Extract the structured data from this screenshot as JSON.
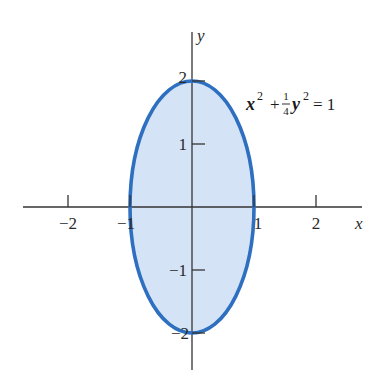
{
  "diagram": {
    "type": "ellipse-region",
    "equation": {
      "display": "x² + ¼y² = 1",
      "x_var": "x",
      "y_var": "y",
      "exp": "2",
      "plus": "+",
      "frac_num": "1",
      "frac_den": "4",
      "equals": "= 1"
    },
    "axes": {
      "x_label": "x",
      "y_label": "y",
      "x_ticks": [
        {
          "value": -2,
          "label": "−2"
        },
        {
          "value": -1,
          "label": "−1"
        },
        {
          "value": 1,
          "label": "1"
        },
        {
          "value": 2,
          "label": "2"
        }
      ],
      "y_ticks": [
        {
          "value": 2,
          "label": "2"
        },
        {
          "value": 1,
          "label": "1"
        },
        {
          "value": -1,
          "label": "−1"
        },
        {
          "value": -2,
          "label": "−2"
        }
      ]
    },
    "ellipse": {
      "center": [
        0,
        0
      ],
      "semi_axis_x": 1,
      "semi_axis_y": 2
    },
    "colors": {
      "fill": "#d4e4f6",
      "stroke": "#2e6fc0",
      "axis": "#333333",
      "text": "#2a2a2a"
    }
  }
}
